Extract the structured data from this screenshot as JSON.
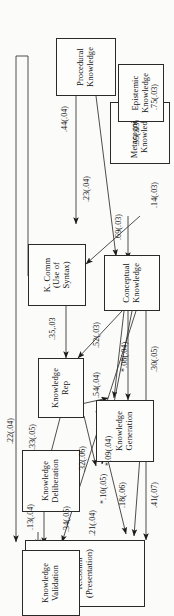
{
  "diagram": {
    "type": "path-diagram",
    "orientation": "rotated-90",
    "nodes": [
      {
        "id": "kcomm_pres",
        "label": "K.Comm\n(Presentation)"
      },
      {
        "id": "kvalid",
        "label": "Knowledge\nValidation"
      },
      {
        "id": "kgen",
        "label": "Knowledge\nGeneration"
      },
      {
        "id": "kdelib",
        "label": "Knowledge\nDeliberation"
      },
      {
        "id": "krep",
        "label": "Knowledge\nRep"
      },
      {
        "id": "concept",
        "label": "Conceptual\nKnowledge"
      },
      {
        "id": "kcomm_syn",
        "label": "K. Comm\n(Use of Syntax)"
      },
      {
        "id": "metacog",
        "label": "Metacognitive\nKnowledge"
      },
      {
        "id": "episteme",
        "label": "Epistemic\nKnowledge"
      },
      {
        "id": "procedural",
        "label": "Procedural\nKnowledge"
      }
    ],
    "node_labels": {
      "kcomm_pres_l1": "K.Comm",
      "kcomm_pres_l2": "(Presentation)",
      "kvalid_l1": "Knowledge",
      "kvalid_l2": "Validation",
      "kgen_l1": "Knowledge",
      "kgen_l2": "Generation",
      "kdelib_l1": "Knowledge",
      "kdelib_l2": "Deliberation",
      "krep_l1": "Knowledge",
      "krep_l2": "Rep",
      "concept_l1": "Conceptual",
      "concept_l2": "Knowledge",
      "kcomm_syn_l1": "K. Comm",
      "kcomm_syn_l2": "(Use of Syntax)",
      "metacog_l1": "Metacognitive",
      "metacog_l2": "Knowledge",
      "episteme_l1": "Epistemic",
      "episteme_l2": "Knowledge",
      "procedural_l1": "Procedural",
      "procedural_l2": "Knowledge"
    },
    "edges": [
      {
        "id": "e_41",
        "label": ".41(.07)",
        "from": "concept",
        "to": "kcomm_pres"
      },
      {
        "id": "e_18",
        "label": ".18(.06)",
        "from": "kgen",
        "to": "kcomm_pres"
      },
      {
        "id": "e_10",
        "label": "*.10(.05)",
        "from": "krep",
        "to": "kcomm_pres"
      },
      {
        "id": "e_13",
        "label": ".13(.04)",
        "from": "kcomm_pres",
        "to": "kvalid"
      },
      {
        "id": "e_34",
        "label": ".34(.05)",
        "from": "concept",
        "to": "kvalid"
      },
      {
        "id": "e_21",
        "label": ".21(.04)",
        "from": "kdelib",
        "to": "kvalid"
      },
      {
        "id": "e_22",
        "label": ".22(.04)",
        "from": "kcomm_syn",
        "to": "kvalid"
      },
      {
        "id": "e_32",
        "label": ".32(.06)",
        "from": "concept",
        "to": "kdelib"
      },
      {
        "id": "e_09",
        "label": "*.09(.04)",
        "from": "krep",
        "to": "kdelib"
      },
      {
        "id": "e_33",
        "label": ".33(.05)",
        "from": "krep",
        "to": "kdelib"
      },
      {
        "id": "e_30",
        "label": ".30(.05)",
        "from": "concept",
        "to": "kgen"
      },
      {
        "id": "e_08",
        "label": "*.08(.04)",
        "from": "concept",
        "to": "kgen"
      },
      {
        "id": "e_54",
        "label": ".54(.04)",
        "from": "krep",
        "to": "kgen"
      },
      {
        "id": "e_52",
        "label": ".52(.03)",
        "from": "concept",
        "to": "krep"
      },
      {
        "id": "e_35",
        "label": ".35,.03",
        "from": "kcomm_syn",
        "to": "krep"
      },
      {
        "id": "e_14",
        "label": ".14(.03)",
        "from": "metacog",
        "to": "concept"
      },
      {
        "id": "e_69",
        "label": ".69(.03)",
        "from": "procedural",
        "to": "concept"
      },
      {
        "id": "e_23",
        "label": ".23(.04)",
        "from": "metacog",
        "to": "kcomm_syn"
      },
      {
        "id": "e_44",
        "label": ".44(.04)",
        "from": "procedural",
        "to": "kcomm_syn"
      },
      {
        "id": "e_55",
        "label": ".55(.03)",
        "from": "metacog",
        "to": "procedural"
      },
      {
        "id": "e_75",
        "label": ".75(.03)",
        "from": "episteme",
        "to": "metacog"
      }
    ],
    "edge_labels": {
      "v41": ".41(.07)",
      "v18": ".18(.06)",
      "v10": "*.10(.05)",
      "v13": ".13(.04)",
      "v34": ".34(.05)",
      "v21": ".21(.04)",
      "v22": ".22(.04)",
      "v32": ".32(.06)",
      "v09": "*.09(.04)",
      "v33": ".33(.05)",
      "v30": ".30(.05)",
      "v08": "*.08(.04)",
      "v54": ".54(.04)",
      "v52": ".52(.03)",
      "v35": ".35,.03",
      "v14": ".14(.03)",
      "v69": ".69(.03)",
      "v23": ".23(.04)",
      "v44": ".44(.04)",
      "v55": ".55(.03)",
      "v75": ".75(.03)"
    },
    "colors": {
      "stroke": "#2a2a2a",
      "node_fill": "#fdfdfc",
      "background": "#fbfbfa",
      "text": "#111111"
    }
  }
}
